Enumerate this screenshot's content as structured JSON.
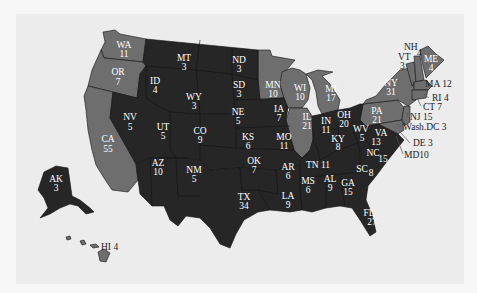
{
  "map": {
    "title": "",
    "colors": {
      "background": "#ececec",
      "party_a": "#262626",
      "party_b": "#6e6e6e",
      "border": "#111111",
      "label_inside": "#ffffff",
      "label_outside": "#222222"
    },
    "states": [
      {
        "abbr": "WA",
        "votes": "11",
        "group": "b"
      },
      {
        "abbr": "OR",
        "votes": "7",
        "group": "b"
      },
      {
        "abbr": "CA",
        "votes": "55",
        "group": "b"
      },
      {
        "abbr": "NV",
        "votes": "5",
        "group": "a"
      },
      {
        "abbr": "ID",
        "votes": "4",
        "group": "a"
      },
      {
        "abbr": "MT",
        "votes": "3",
        "group": "a"
      },
      {
        "abbr": "WY",
        "votes": "3",
        "group": "a"
      },
      {
        "abbr": "UT",
        "votes": "5",
        "group": "a"
      },
      {
        "abbr": "CO",
        "votes": "9",
        "group": "a"
      },
      {
        "abbr": "AZ",
        "votes": "10",
        "group": "a"
      },
      {
        "abbr": "NM",
        "votes": "5",
        "group": "a"
      },
      {
        "abbr": "ND",
        "votes": "3",
        "group": "a"
      },
      {
        "abbr": "SD",
        "votes": "3",
        "group": "a"
      },
      {
        "abbr": "NE",
        "votes": "5",
        "group": "a"
      },
      {
        "abbr": "KS",
        "votes": "6",
        "group": "a"
      },
      {
        "abbr": "OK",
        "votes": "7",
        "group": "a"
      },
      {
        "abbr": "TX",
        "votes": "34",
        "group": "a"
      },
      {
        "abbr": "MN",
        "votes": "10",
        "group": "b"
      },
      {
        "abbr": "IA",
        "votes": "7",
        "group": "a"
      },
      {
        "abbr": "MO",
        "votes": "11",
        "group": "a"
      },
      {
        "abbr": "AR",
        "votes": "6",
        "group": "a"
      },
      {
        "abbr": "LA",
        "votes": "9",
        "group": "a"
      },
      {
        "abbr": "WI",
        "votes": "10",
        "group": "b"
      },
      {
        "abbr": "IL",
        "votes": "21",
        "group": "b"
      },
      {
        "abbr": "MI",
        "votes": "17",
        "group": "b"
      },
      {
        "abbr": "IN",
        "votes": "11",
        "group": "a"
      },
      {
        "abbr": "OH",
        "votes": "20",
        "group": "a"
      },
      {
        "abbr": "KY",
        "votes": "8",
        "group": "a"
      },
      {
        "abbr": "TN",
        "votes": "11",
        "group": "a"
      },
      {
        "abbr": "MS",
        "votes": "6",
        "group": "a"
      },
      {
        "abbr": "AL",
        "votes": "9",
        "group": "a"
      },
      {
        "abbr": "GA",
        "votes": "15",
        "group": "a"
      },
      {
        "abbr": "FL",
        "votes": "27",
        "group": "a"
      },
      {
        "abbr": "SC",
        "votes": "8",
        "group": "a"
      },
      {
        "abbr": "NC",
        "votes": "15",
        "group": "a"
      },
      {
        "abbr": "VA",
        "votes": "13",
        "group": "a"
      },
      {
        "abbr": "WV",
        "votes": "5",
        "group": "a"
      },
      {
        "abbr": "PA",
        "votes": "21",
        "group": "b"
      },
      {
        "abbr": "NY",
        "votes": "31",
        "group": "b"
      },
      {
        "abbr": "VT",
        "votes": "3",
        "group": "b"
      },
      {
        "abbr": "NH",
        "votes": "4",
        "group": "b"
      },
      {
        "abbr": "ME",
        "votes": "4",
        "group": "b"
      },
      {
        "abbr": "MA",
        "votes": "12",
        "group": "b"
      },
      {
        "abbr": "RI",
        "votes": "4",
        "group": "b"
      },
      {
        "abbr": "CT",
        "votes": "7",
        "group": "b"
      },
      {
        "abbr": "NJ",
        "votes": "15",
        "group": "b"
      },
      {
        "abbr": "DE",
        "votes": "3",
        "group": "b"
      },
      {
        "abbr": "MD",
        "votes": "10",
        "group": "b"
      },
      {
        "abbr": "Wash.DC",
        "votes": "3",
        "group": "b"
      },
      {
        "abbr": "AK",
        "votes": "3",
        "group": "a"
      },
      {
        "abbr": "HI",
        "votes": "4",
        "group": "b"
      }
    ],
    "labels": {
      "WA": "WA",
      "WA_v": "11",
      "OR": "OR",
      "OR_v": "7",
      "CA": "CA",
      "CA_v": "55",
      "NV": "NV",
      "NV_v": "5",
      "ID": "ID",
      "ID_v": "4",
      "MT": "MT",
      "MT_v": "3",
      "WY": "WY",
      "WY_v": "3",
      "UT": "UT",
      "UT_v": "5",
      "CO": "CO",
      "CO_v": "9",
      "AZ": "AZ",
      "AZ_v": "10",
      "NM": "NM",
      "NM_v": "5",
      "ND": "ND",
      "ND_v": "3",
      "SD": "SD",
      "SD_v": "3",
      "NE": "NE",
      "NE_v": "5",
      "KS": "KS",
      "KS_v": "6",
      "OK": "OK",
      "OK_v": "7",
      "TX": "TX",
      "TX_v": "34",
      "MN": "MN",
      "MN_v": "10",
      "IA": "IA",
      "IA_v": "7",
      "MO": "MO",
      "MO_v": "11",
      "AR": "AR",
      "AR_v": "6",
      "LA": "LA",
      "LA_v": "9",
      "WI": "WI",
      "WI_v": "10",
      "IL": "IL",
      "IL_v": "21",
      "MI": "MI",
      "MI_v": "17",
      "IN": "IN",
      "IN_v": "11",
      "OH": "OH",
      "OH_v": "20",
      "KY": "KY",
      "KY_v": "8",
      "TN": "TN 11",
      "MS": "MS",
      "MS_v": "6",
      "AL": "AL",
      "AL_v": "9",
      "GA": "GA",
      "GA_v": "15",
      "FL": "FL",
      "FL_v": "27",
      "SC": "SC",
      "SC_v": "8",
      "NC": "NC",
      "NC_v": "15",
      "VA": "VA",
      "VA_v": "13",
      "WV": "WV",
      "WV_v": "5",
      "PA": "PA",
      "PA_v": "21",
      "NY": "NY",
      "NY_v": "31",
      "VT": "VT",
      "VT_v": "3",
      "NH": "NH",
      "NH_v": "4",
      "ME": "ME",
      "ME_v": "4",
      "AK": "AK",
      "AK_v": "3",
      "MA": "MA 12",
      "RI": "RI 4",
      "CT": "CT 7",
      "NJ": "NJ 15",
      "DC": "Wash.DC 3",
      "DE": "DE 3",
      "MD": "MD10",
      "HI": "HI 4"
    }
  }
}
